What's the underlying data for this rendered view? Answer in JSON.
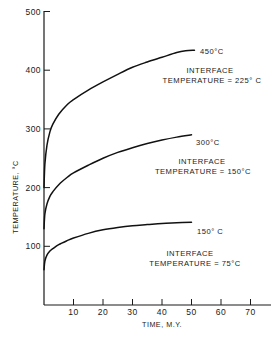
{
  "chart_data": {
    "type": "line",
    "title": "",
    "xlabel": "TIME, M.Y.",
    "ylabel": "TEMPERATURE, °C",
    "xlim": [
      0,
      77
    ],
    "ylim": [
      0,
      500
    ],
    "xticks": [
      10,
      20,
      30,
      40,
      50,
      60,
      70
    ],
    "yticks": [
      100,
      200,
      300,
      400,
      500
    ],
    "grid": false,
    "legend": "none (inline curve labels)",
    "series": [
      {
        "name": "450°C",
        "annotation": [
          "INTERFACE",
          "TEMPERATURE = 225° C"
        ],
        "x": [
          0,
          0.3,
          1,
          2,
          3,
          5,
          8,
          10,
          15,
          20,
          25,
          30,
          35,
          40,
          45,
          48,
          51
        ],
        "y": [
          200,
          240,
          272,
          295,
          308,
          325,
          342,
          350,
          366,
          380,
          393,
          405,
          414,
          422,
          430,
          433,
          434
        ]
      },
      {
        "name": "300°C",
        "annotation": [
          "INTERFACE",
          "TEMPERATURE = 150°C"
        ],
        "x": [
          0,
          0.3,
          1,
          2,
          3,
          5,
          8,
          10,
          15,
          20,
          25,
          30,
          35,
          40,
          45,
          50
        ],
        "y": [
          130,
          155,
          172,
          185,
          193,
          205,
          218,
          225,
          238,
          250,
          260,
          268,
          275,
          281,
          286,
          290
        ]
      },
      {
        "name": "150°C",
        "annotation": [
          "INTERFACE",
          "TEMPERATURE = 75°C"
        ],
        "x": [
          0,
          0.3,
          1,
          2,
          3,
          5,
          8,
          10,
          15,
          20,
          25,
          30,
          35,
          40,
          45,
          50
        ],
        "y": [
          60,
          75,
          85,
          92,
          96,
          103,
          110,
          114,
          122,
          128,
          132,
          135,
          137,
          139,
          140,
          141
        ]
      }
    ]
  },
  "labels": {
    "ylabel": "TEMPERATURE, °C",
    "xlabel": "TIME, M.Y.",
    "series0_name": "450°C",
    "series0_ann1": "INTERFACE",
    "series0_ann2": "TEMPERATURE = 225° C",
    "series1_name": "300°C",
    "series1_ann1": "INTERFACE",
    "series1_ann2": "TEMPERATURE = 150°C",
    "series2_name": "150° C",
    "series2_ann1": "INTERFACE",
    "series2_ann2": "TEMPERATURE = 75°C"
  }
}
